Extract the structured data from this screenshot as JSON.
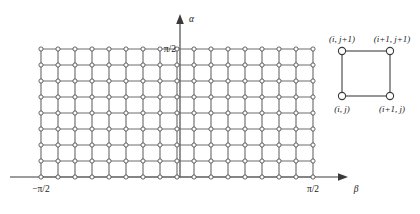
{
  "figure": {
    "background_color": "#ffffff",
    "line_color": "#6e6e6e",
    "axis_color": "#3a3a3a",
    "node_fill": "#ffffff",
    "node_stroke": "#4a4a4a"
  },
  "axes": {
    "vertical": {
      "name": "α",
      "icon": "up-arrow-icon",
      "top_tick_label": "π/2"
    },
    "horizontal": {
      "name": "β",
      "icon": "right-arrow-icon",
      "left_tick_label": "−π/2",
      "right_tick_label": "π/2"
    }
  },
  "grid": {
    "columns": 16,
    "rows": 8,
    "node_columns": 17,
    "node_rows": 9,
    "x_start": 41,
    "x_end": 313,
    "y_top": 49,
    "y_bottom": 177,
    "cell_width": 17,
    "cell_height": 16,
    "node_radius": 2.1
  },
  "inset": {
    "x_left": 342,
    "x_right": 390,
    "y_top": 51,
    "y_bottom": 96,
    "node_radius": 3.6,
    "labels": {
      "top_left": "(i, j+1)",
      "top_right": "(i+1, j+1)",
      "bottom_left": "(i, j)",
      "bottom_right": "(i+1, j)"
    }
  },
  "chart_data": {
    "type": "scatter",
    "title": "",
    "xlabel": "β",
    "ylabel": "α",
    "xlim": [
      -1.5707963,
      1.5707963
    ],
    "ylim": [
      0,
      1.5707963
    ],
    "xticks": [
      -1.5707963,
      1.5707963
    ],
    "xticklabels": [
      "−π/2",
      "π/2"
    ],
    "yticks": [
      1.5707963
    ],
    "yticklabels": [
      "π/2"
    ],
    "grid": true,
    "legend": false,
    "series": [
      {
        "name": "lattice nodes",
        "n_nodes": 153,
        "marker": "open-circle"
      }
    ]
  }
}
